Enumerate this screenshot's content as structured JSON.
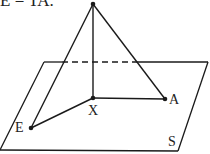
{
  "caption": "E = TA.",
  "labels": {
    "x": "X",
    "a": "A",
    "e": "E",
    "s": "S"
  },
  "colors": {
    "line": "#1a1a1a",
    "background": "#ffffff"
  }
}
